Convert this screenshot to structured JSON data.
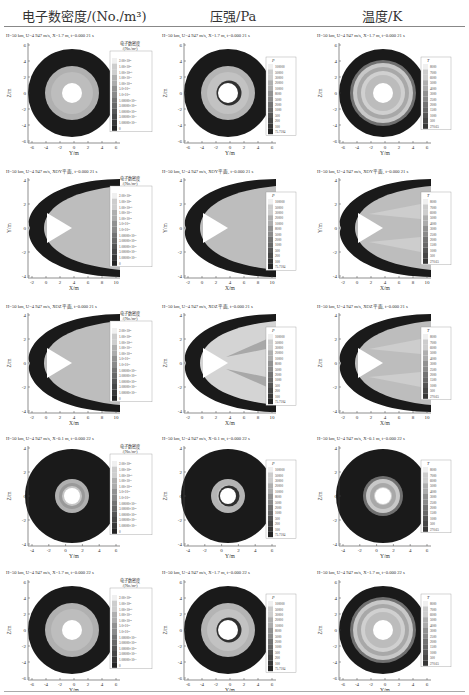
{
  "header": {
    "columns": [
      {
        "title": "电子数密度/(No./m³)",
        "x": 22
      },
      {
        "title": "压强/Pa",
        "x": 210
      },
      {
        "title": "温度/K",
        "x": 362
      }
    ]
  },
  "rows": [
    {
      "caption": "H=50 km, U=4 947 m/s, X=1.7 m, t=0.000 21 s",
      "type": "circle",
      "y_label": "Z/m",
      "x_label": "Y/m",
      "x_ticks": [
        "-6",
        "-4",
        "-2",
        "0",
        "2",
        "4",
        "6"
      ],
      "y_ticks": [
        "6",
        "4",
        "2",
        "0",
        "-2",
        "-4",
        "-6"
      ]
    },
    {
      "caption": "H=50 km, U=4 947 m/s, XOY平面, t=0.000 21 s",
      "type": "cone",
      "y_label": "Y/m",
      "x_label": "X/m",
      "x_ticks": [
        "-2",
        "0",
        "2",
        "4",
        "6",
        "8",
        "10"
      ],
      "y_ticks": [
        "4",
        "2",
        "0",
        "-2",
        "-4"
      ]
    },
    {
      "caption": "H=50 km, U=4 947 m/s, XOZ平面, t=0.000 21 s",
      "type": "cone",
      "y_label": "Z/m",
      "x_label": "X/m",
      "x_ticks": [
        "-2",
        "0",
        "2",
        "4",
        "6",
        "8",
        "10"
      ],
      "y_ticks": [
        "4",
        "2",
        "0",
        "-2",
        "-4"
      ]
    },
    {
      "caption": "H=50 km, U=4 947 m/s, X=0.1 m, t=0.000 22 s",
      "type": "circle-small",
      "y_label": "Z/m",
      "x_label": "Y/m",
      "x_ticks": [
        "-4",
        "-2",
        "0",
        "2",
        "4",
        "6"
      ],
      "y_ticks": [
        "4",
        "2",
        "0",
        "-2",
        "-4"
      ]
    },
    {
      "caption": "H=50 km, U=4 947 m/s, X=1.7 m, t=0.000 22 s",
      "type": "circle",
      "y_label": "Z/m",
      "x_label": "Y/m",
      "x_ticks": [
        "-6",
        "-4",
        "-2",
        "0",
        "2",
        "4",
        "6"
      ],
      "y_ticks": [
        "6",
        "4",
        "2",
        "0",
        "-2",
        "-4",
        "-6"
      ]
    }
  ],
  "legends": {
    "electron": {
      "title_line1": "电子数密度",
      "title_line2": "/(No./m³)",
      "levels": [
        "2.00×10²¹",
        "1.00×10²¹",
        "1.00×10²⁰",
        "1.00×10¹⁹",
        "1.00×10¹⁸",
        "5.0×10¹⁷",
        "1.0×10¹⁷",
        "1.00000×10¹⁶",
        "3.00000×10¹⁵",
        "1.00000×10¹⁵",
        "3.00000×10¹⁴",
        "1.00000×10¹⁴",
        "0"
      ]
    },
    "pressure": {
      "title": "P",
      "levels": [
        "100000",
        "50000",
        "30000",
        "20000",
        "10000",
        "8000",
        "5000",
        "2000",
        "1000",
        "500",
        "200",
        "100",
        "75.7184"
      ]
    },
    "temperature": {
      "title": "T",
      "levels": [
        "8000",
        "7000",
        "6000",
        "5000",
        "4000",
        "3000",
        "2500",
        "2000",
        "1500",
        "1000",
        "500",
        "270.65"
      ]
    }
  },
  "colors": {
    "dark": "#1a1a1a",
    "mid": "#b8b8b8",
    "light": "#d6d6d6",
    "axis": "#444444"
  }
}
